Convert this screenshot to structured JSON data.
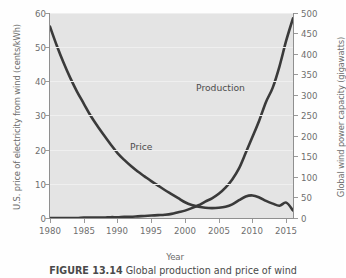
{
  "figure": {
    "caption_label": "FIGURE 13.14",
    "caption_text": "Global production and price of wind",
    "xlabel": "Year"
  },
  "axes": {
    "left": {
      "title": "U.S. price of electricity from wind (cents/kWh)",
      "ticks": [
        "0",
        "10",
        "20",
        "30",
        "40",
        "50",
        "60"
      ],
      "min": 0,
      "max": 60
    },
    "right": {
      "title": "Global wind power capacity (gigawatts)",
      "ticks": [
        "0",
        "50",
        "100",
        "150",
        "200",
        "250",
        "300",
        "350",
        "400",
        "450",
        "500"
      ],
      "min": 0,
      "max": 500
    },
    "x": {
      "ticks": [
        "1980",
        "1985",
        "1990",
        "1995",
        "2000",
        "2005",
        "2010",
        "2015"
      ],
      "min": 1980,
      "max": 2016
    }
  },
  "annotations": {
    "production": "Production",
    "price": "Price"
  },
  "colors": {
    "plot_background": "#e4e4e4",
    "line": "#3a3a3a",
    "gridline": "#efefef",
    "axis": "#8f8f8f",
    "text": "#6b6b6b"
  },
  "chart_data": {
    "type": "line",
    "title": "Global production and price of wind",
    "xlabel": "Year",
    "ylabel": "U.S. price of electricity from wind (cents/kWh)",
    "y2label": "Global wind power capacity (gigawatts)",
    "xlim": [
      1980,
      2016
    ],
    "ylim": [
      0,
      60
    ],
    "y2lim": [
      0,
      500
    ],
    "grid": true,
    "legend": "inline-annotations",
    "x": [
      1980,
      1981,
      1982,
      1983,
      1984,
      1985,
      1986,
      1987,
      1988,
      1989,
      1990,
      1991,
      1992,
      1993,
      1994,
      1995,
      1996,
      1997,
      1998,
      1999,
      2000,
      2001,
      2002,
      2003,
      2004,
      2005,
      2006,
      2007,
      2008,
      2009,
      2010,
      2011,
      2012,
      2013,
      2014,
      2015,
      2016
    ],
    "series": [
      {
        "name": "Price",
        "axis": "left",
        "units": "cents/kWh",
        "values": [
          56.0,
          50.5,
          45.5,
          41.0,
          37.0,
          33.5,
          30.0,
          27.0,
          24.2,
          21.5,
          19.0,
          17.0,
          15.2,
          13.6,
          12.2,
          10.8,
          9.5,
          8.2,
          7.0,
          5.8,
          4.6,
          3.8,
          3.3,
          3.0,
          2.9,
          3.0,
          3.3,
          4.0,
          5.2,
          6.3,
          6.6,
          6.0,
          5.0,
          4.2,
          3.6,
          4.5,
          2.2
        ]
      },
      {
        "name": "Production",
        "axis": "right",
        "units": "gigawatts",
        "values": [
          0,
          0,
          0,
          0,
          0,
          1,
          1,
          1,
          1,
          2,
          2,
          3,
          3,
          4,
          5,
          6,
          7,
          8,
          10,
          14,
          18,
          24,
          31,
          40,
          48,
          59,
          74,
          94,
          121,
          159,
          198,
          238,
          283,
          318,
          370,
          433,
          487
        ]
      }
    ]
  }
}
